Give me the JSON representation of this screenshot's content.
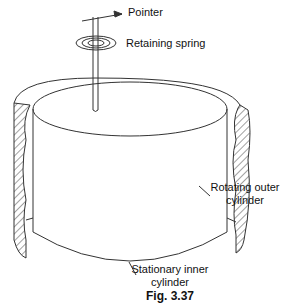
{
  "diagram": {
    "type": "rotational viscometer schematic",
    "labels": {
      "pointer": "Pointer",
      "retaining_spring": "Retaining spring",
      "rotating_outer_line1": "Rotating outer",
      "rotating_outer_line2": "cylinder",
      "stationary_inner_line1": "Stationary inner",
      "stationary_inner_line2": "cylinder"
    },
    "caption": "Fig. 3.37",
    "colors": {
      "line": "#333333",
      "background": "#ffffff"
    }
  }
}
